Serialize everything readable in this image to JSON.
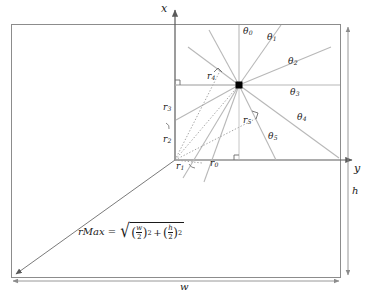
{
  "figure": {
    "background": "#ffffff",
    "colors": {
      "frame": "#8c8c8c",
      "axis": "#6b6b6b",
      "ray": "#b3b3b3",
      "dotted": "#9a9a9a",
      "text": "#1a1a1a",
      "center_point": "#000000",
      "dimension": "#8c8c8c"
    },
    "axes": {
      "x_label": "x",
      "y_label": "y",
      "origin_description": "axis origin at center-left of inner quadrant"
    },
    "dimensions": {
      "width_label": "w",
      "height_label": "h"
    },
    "center_marker": {
      "shape": "filled-square",
      "description": "sample center point"
    },
    "angles": [
      {
        "id": "theta0",
        "base": "θ",
        "sub": "0"
      },
      {
        "id": "theta1",
        "base": "θ",
        "sub": "1"
      },
      {
        "id": "theta2",
        "base": "θ",
        "sub": "2"
      },
      {
        "id": "theta3",
        "base": "θ",
        "sub": "3"
      },
      {
        "id": "theta4",
        "base": "θ",
        "sub": "4"
      },
      {
        "id": "theta5",
        "base": "θ",
        "sub": "5"
      }
    ],
    "radii": [
      {
        "id": "r0",
        "base": "r",
        "sub": "0"
      },
      {
        "id": "r1",
        "base": "r",
        "sub": "1"
      },
      {
        "id": "r2",
        "base": "r",
        "sub": "2"
      },
      {
        "id": "r3",
        "base": "r",
        "sub": "3"
      },
      {
        "id": "r4",
        "base": "r",
        "sub": "4"
      },
      {
        "id": "r5",
        "base": "r",
        "sub": "5"
      }
    ],
    "formula": {
      "name": "rMax",
      "equals": "=",
      "radical_sign": "√",
      "term1": {
        "numerator": "w",
        "denominator": "2",
        "exponent": "2"
      },
      "operator": "+",
      "term2": {
        "numerator": "h",
        "denominator": "2",
        "exponent": "2"
      },
      "open_paren": "(",
      "close_paren": ")",
      "plain": "rMax = √((w/2)² + (h/2)²)"
    }
  }
}
